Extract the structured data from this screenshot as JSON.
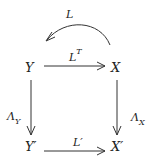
{
  "diagram": {
    "type": "commutative-diagram",
    "nodes": {
      "Y": {
        "label": "Y"
      },
      "X": {
        "label": "X"
      },
      "Yp": {
        "label": "Y",
        "prime": "′"
      },
      "Xp": {
        "label": "X",
        "prime": "′"
      }
    },
    "edges": {
      "L": {
        "label": "L",
        "from": "X",
        "to": "Y",
        "style": "curved"
      },
      "LT": {
        "label": "L",
        "sup": "T",
        "from": "Y",
        "to": "X"
      },
      "LambdaY": {
        "label": "Λ",
        "sub": "Y",
        "from": "Y",
        "to": "Y′"
      },
      "LambdaX": {
        "label": "Λ",
        "sub": "X",
        "from": "X",
        "to": "X′"
      },
      "Lp": {
        "label": "L",
        "prime": "′",
        "from": "Y′",
        "to": "X′"
      }
    },
    "colors": {
      "stroke": "#333333",
      "text": "#222222",
      "background": "#ffffff"
    }
  }
}
